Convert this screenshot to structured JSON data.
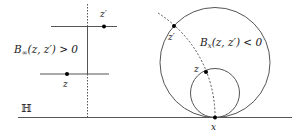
{
  "figure": {
    "left_panel": {
      "label": "B∞(z, z′) > 0",
      "label_main": "B",
      "label_sub": "∞",
      "label_args": "(z, z′) > 0",
      "point_top_label": "z′",
      "point_bottom_label": "z"
    },
    "right_panel": {
      "label_main": "B",
      "label_sub": "x",
      "label_args": "(z, z′) < 0",
      "point_outer_label": "z′",
      "point_inner_label": "z",
      "tangent_point_label": "x"
    },
    "halfplane_label": "ℍ",
    "colors": {
      "line": "#555555",
      "point": "#000000",
      "text": "#1a1a1a"
    }
  }
}
